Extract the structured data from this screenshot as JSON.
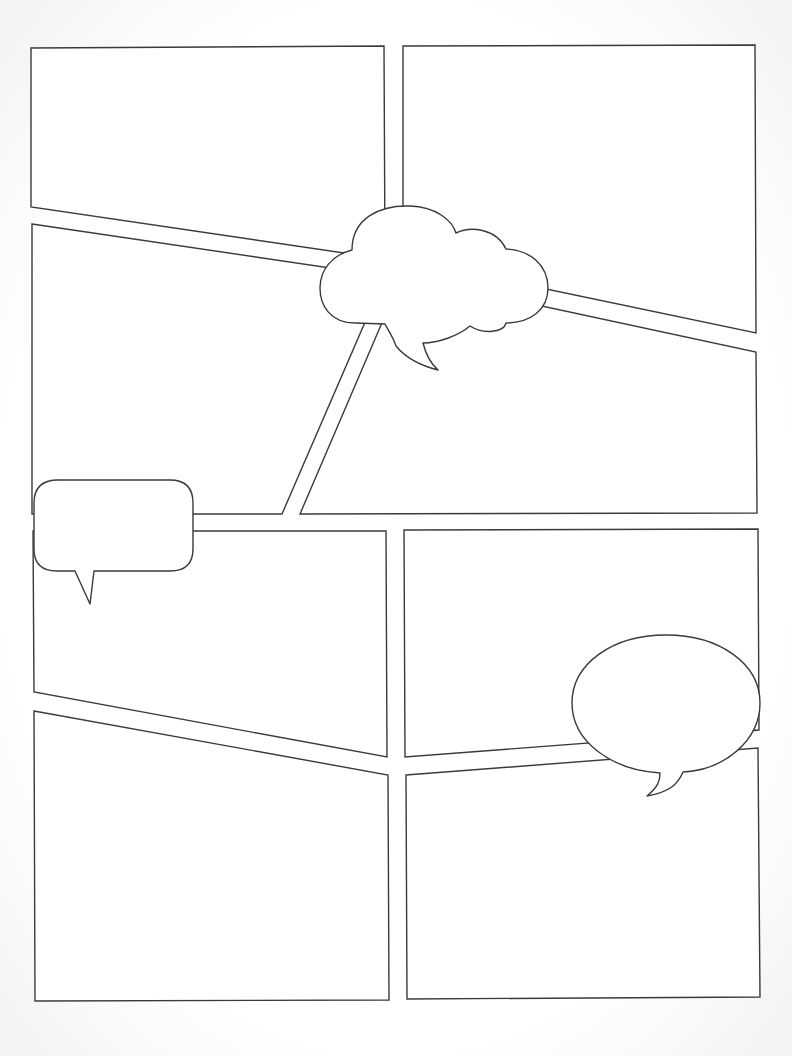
{
  "page": {
    "background": "#ffffff",
    "stroke_color": "#3a3a3a",
    "width": 792,
    "height": 1056
  },
  "panels": [
    {
      "id": "panel-1",
      "points": "31,48 384,46 385,259 31,207"
    },
    {
      "id": "panel-2",
      "points": "403,46 755,45 756,333 403,259"
    },
    {
      "id": "panel-3",
      "points": "32,224 385,276 282,514 32,514"
    },
    {
      "id": "panel-4",
      "points": "402,276 756,352 757,513 300,514"
    },
    {
      "id": "panel-5",
      "points": "33,531 386,531 387,757 34,692"
    },
    {
      "id": "panel-6",
      "points": "404,530 758,529 759,730 405,757"
    },
    {
      "id": "panel-7",
      "points": "34,711 388,775 389,1000 35,1001"
    },
    {
      "id": "panel-8",
      "points": "406,775 758,748 760,997 407,999"
    }
  ],
  "balloons": [
    {
      "id": "thought-cloud-balloon",
      "kind": "cloud",
      "path": "M352,250 C352,218 380,205 410,206 C436,207 452,220 456,233 C470,226 496,228 506,249 C530,250 548,265 548,288 C548,310 530,323 506,323 C504,332 484,335 470,326 C458,336 438,343 423,343 C426,355 430,363 438,370 C418,365 405,357 396,346 C393,337 388,330 385,324 L355,323 C330,323 320,305 320,288 C320,270 332,255 352,250 Z"
    },
    {
      "id": "rounded-speech-balloon",
      "kind": "rounded",
      "path": "M58,480 L170,480 Q193,480 193,503 L193,549 Q193,571 170,571 L94,571 L90,604 L75,571 L57,571 Q34,571 34,549 L34,503 Q34,480 58,480 Z"
    },
    {
      "id": "oval-speech-balloon",
      "kind": "oval",
      "path": "M666,635 C720,635 760,664 760,703 C760,740 725,770 683,772 C678,784 670,792 647,796 C658,787 660,781 660,773 C612,770 572,742 572,703 C572,664 612,635 666,635 Z"
    }
  ],
  "text": []
}
